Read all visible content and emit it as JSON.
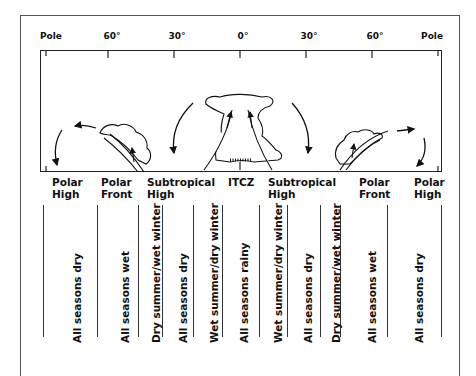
{
  "diagram": {
    "latitude_ticks": [
      {
        "label": "Pole",
        "x": 40
      },
      {
        "label": "60°",
        "x": 112
      },
      {
        "label": "30°",
        "x": 177
      },
      {
        "label": "0°",
        "x": 243
      },
      {
        "label": "30°",
        "x": 309
      },
      {
        "label": "60°",
        "x": 375
      },
      {
        "label": "Pole",
        "x": 443
      }
    ],
    "pressure_zones": [
      {
        "line1": "Polar",
        "line2": "High",
        "x": 52
      },
      {
        "line1": "Polar",
        "line2": "Front",
        "x": 101
      },
      {
        "line1": "Subtropical",
        "line2": "High",
        "x": 147
      },
      {
        "line1": "ITCZ",
        "line2": "",
        "x": 228
      },
      {
        "line1": "Subtropical",
        "line2": "High",
        "x": 268
      },
      {
        "line1": "Polar",
        "line2": "Front",
        "x": 359
      },
      {
        "line1": "Polar",
        "line2": "High",
        "x": 414
      }
    ],
    "precipitation_columns": [
      {
        "label": "All seasons dry",
        "x": 77
      },
      {
        "label": "All seasons wet",
        "x": 125
      },
      {
        "label": "Dry summer/wet winter",
        "x": 156
      },
      {
        "label": "All seasons dry",
        "x": 183
      },
      {
        "label": "Wet summer/dry winter",
        "x": 214
      },
      {
        "label": "All seasons rainy",
        "x": 244
      },
      {
        "label": "Wet summer/dry winter",
        "x": 278
      },
      {
        "label": "All seasons dry",
        "x": 308
      },
      {
        "label": "Dry summer/wet winter",
        "x": 336
      },
      {
        "label": "All seasons wet",
        "x": 372
      },
      {
        "label": "All seasons dry",
        "x": 419
      }
    ],
    "column_dividers": [
      {
        "x": 43,
        "h": 132
      },
      {
        "x": 97,
        "h": 132
      },
      {
        "x": 138,
        "h": 132
      },
      {
        "x": 162,
        "h": 132
      },
      {
        "x": 193,
        "h": 132
      },
      {
        "x": 222,
        "h": 132
      },
      {
        "x": 259,
        "h": 132
      },
      {
        "x": 287,
        "h": 132
      },
      {
        "x": 320,
        "h": 132
      },
      {
        "x": 340,
        "h": 132
      },
      {
        "x": 387,
        "h": 132
      },
      {
        "x": 441,
        "h": 132
      }
    ],
    "colors": {
      "ink": "#111111",
      "frame": "#555555",
      "background": "#ffffff"
    }
  }
}
